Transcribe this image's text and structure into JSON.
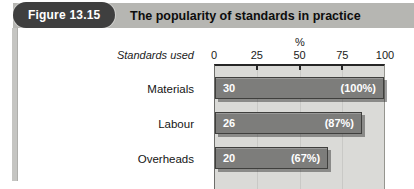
{
  "figure": {
    "badge_label": "Figure 13.15",
    "title": "The popularity of standards in practice"
  },
  "chart": {
    "unit_label": "%",
    "axis_title": "Standards used"
  },
  "chart_data": {
    "type": "bar",
    "orientation": "horizontal",
    "title": "The popularity of standards in practice",
    "axis_title": "Standards used",
    "categories": [
      "Materials",
      "Labour",
      "Overheads"
    ],
    "values": [
      30,
      26,
      20
    ],
    "percents": [
      100,
      87,
      67
    ],
    "percent_labels": [
      "(100%)",
      "(87%)",
      "(67%)"
    ],
    "xlabel": "%",
    "xlim": [
      0,
      100
    ],
    "xticks": [
      "0",
      "25",
      "50",
      "75",
      "100"
    ],
    "grid": true,
    "legend": false
  },
  "colors": {
    "header_bg": "#b6b6b2",
    "badge_bg": "#3f3f3f",
    "badge_text": "#ffffff",
    "plot_bg": "#dadad7",
    "bar_fill": "#7d7d7b",
    "bar_border": "#3f3f3d",
    "bar_text": "#ffffff",
    "axis_line": "#262626"
  }
}
